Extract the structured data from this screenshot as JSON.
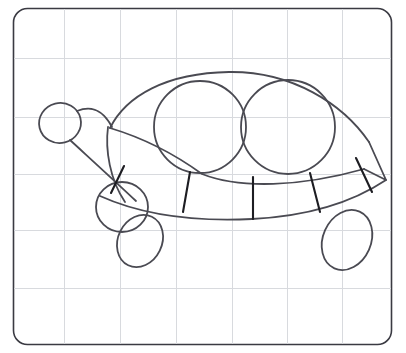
{
  "canvas": {
    "width": 406,
    "height": 353,
    "background_color": "#ffffff",
    "title": "Turtle line drawing on grid paper"
  },
  "paper": {
    "name": "grid-paper",
    "border_color": "#3a3a42",
    "border_width": 1.6,
    "corner_radius": 14,
    "fill_color": "#ffffff",
    "rect": {
      "x": 13,
      "y": 8,
      "width": 379,
      "height": 337
    }
  },
  "grid": {
    "line_color": "#d8dade",
    "line_width": 1,
    "vertical_x": [
      64,
      120,
      176,
      232,
      287,
      342
    ],
    "horizontal_y": [
      58,
      117,
      174,
      230,
      288
    ]
  },
  "drawing": {
    "stroke_color": "#4a4a52",
    "stroke_color_dark": "#1d1d22",
    "stroke_width": 1.8,
    "segment_stroke_width": 2.1,
    "subject": "turtle",
    "parts": [
      {
        "name": "shell-outline",
        "label": "Shell outline"
      },
      {
        "name": "shell-circle-left",
        "label": "Left shell circle"
      },
      {
        "name": "shell-circle-right",
        "label": "Right shell circle"
      },
      {
        "name": "body-bottom-rim",
        "label": "Lower body rim"
      },
      {
        "name": "shell-segment-lines",
        "label": "Shell segment dividers",
        "count": 5
      },
      {
        "name": "head",
        "label": "Head"
      },
      {
        "name": "neck",
        "label": "Neck"
      },
      {
        "name": "front-leg",
        "label": "Front leg"
      },
      {
        "name": "front-foot",
        "label": "Front foot"
      },
      {
        "name": "rear-leg",
        "label": "Rear leg"
      }
    ]
  },
  "shapes": {
    "head_circle": {
      "cx": 60,
      "cy": 123,
      "rx": 21,
      "ry": 20,
      "rotate": -14
    },
    "shell_circle_left": {
      "cx": 200,
      "cy": 127,
      "r": 46
    },
    "shell_circle_right": {
      "cx": 288,
      "cy": 127,
      "r": 47
    },
    "front_leg_circle": {
      "cx": 122,
      "cy": 207,
      "rx": 26,
      "ry": 25
    },
    "front_foot_oval": {
      "cx": 140,
      "cy": 240,
      "rx": 22,
      "ry": 27,
      "rotate": 28
    },
    "rear_leg_oval": {
      "cx": 348,
      "cy": 240,
      "rx": 24,
      "ry": 31,
      "rotate": 22
    },
    "shell_outline_path": "M 110 128 C 130 95 168 74 228 72 C 290 70 340 102 368 140 L 385 180 L 368 168 C 330 142 280 128 228 128 C 180 128 140 128 110 128 Z",
    "segment_lines": [
      {
        "x1": 124,
        "y1": 166,
        "x2": 111,
        "y2": 192
      },
      {
        "x1": 190,
        "y1": 172,
        "x2": 183,
        "y2": 211
      },
      {
        "x1": 253,
        "y1": 177,
        "x2": 253,
        "y2": 218
      },
      {
        "x1": 310,
        "y1": 173,
        "x2": 320,
        "y2": 211
      },
      {
        "x1": 356,
        "y1": 158,
        "x2": 372,
        "y2": 192
      }
    ]
  }
}
